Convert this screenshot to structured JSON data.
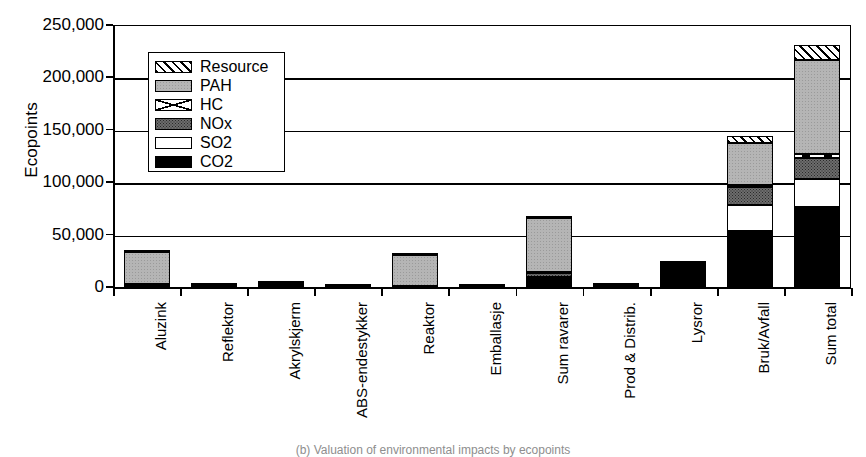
{
  "chart_data": {
    "type": "bar",
    "subtype": "stacked-vertical",
    "title": "",
    "xlabel": "",
    "ylabel": "Ecopoints",
    "ylim": [
      0,
      250000
    ],
    "yticks": [
      0,
      50000,
      100000,
      150000,
      200000,
      250000
    ],
    "ytick_labels": [
      "0",
      "50,000",
      "100,000",
      "150,000",
      "200,000",
      "250,000"
    ],
    "grid": true,
    "legend_position": "upper-left-inside",
    "categories": [
      "Aluzink",
      "Reflektor",
      "Akrylskjerm",
      "ABS-endestykker",
      "Reaktor",
      "Emballasje",
      "Sum ravarer",
      "Prod & Distrib.",
      "Lysror",
      "Bruk/Avfall",
      "Sum total"
    ],
    "series": [
      {
        "name": "CO2",
        "pattern": "solid-black",
        "color": "#000000",
        "values": [
          2000,
          1700,
          3500,
          500,
          400,
          300,
          8000,
          2000,
          21500,
          53500,
          76500
        ]
      },
      {
        "name": "SO2",
        "pattern": "solid-white",
        "color": "#ffffff",
        "values": [
          400,
          200,
          200,
          100,
          100,
          100,
          1500,
          100,
          400,
          24500,
          26500
        ]
      },
      {
        "name": "NOx",
        "pattern": "dotted-dark-gray",
        "color": "#6d6d6d",
        "values": [
          300,
          100,
          100,
          50,
          100,
          50,
          3500,
          100,
          300,
          17000,
          20500
        ]
      },
      {
        "name": "HC",
        "pattern": "white-with-x",
        "color": "#ffffff",
        "values": [
          100,
          50,
          50,
          20,
          50,
          20,
          1200,
          50,
          100,
          2500,
          3500
        ]
      },
      {
        "name": "PAH",
        "pattern": "light-gray",
        "color": "#b5b5b5",
        "values": [
          30700,
          200,
          150,
          100,
          30000,
          50,
          52000,
          150,
          150,
          40000,
          90000
        ]
      },
      {
        "name": "Resource",
        "pattern": "diagonal-hatch",
        "color": "#ffffff",
        "values": [
          200,
          50,
          50,
          20,
          200,
          20,
          800,
          50,
          100,
          7000,
          14000
        ]
      }
    ],
    "totals": [
      33700,
      2300,
      4050,
      790,
      30850,
      540,
      67000,
      2450,
      22550,
      144500,
      231000
    ],
    "legend_entries": [
      "Resource",
      "PAH",
      "HC",
      "NOx",
      "SO2",
      "CO2"
    ]
  },
  "caption": "(b) Valuation of environmental impacts by ecopoints",
  "legend": {
    "items": [
      {
        "label": "Resource",
        "pattern": "diagonal-hatch"
      },
      {
        "label": "PAH",
        "pattern": "light-gray"
      },
      {
        "label": "HC",
        "pattern": "white-with-x"
      },
      {
        "label": "NOx",
        "pattern": "dotted-dark-gray"
      },
      {
        "label": "SO2",
        "pattern": "solid-white"
      },
      {
        "label": "CO2",
        "pattern": "solid-black"
      }
    ]
  }
}
